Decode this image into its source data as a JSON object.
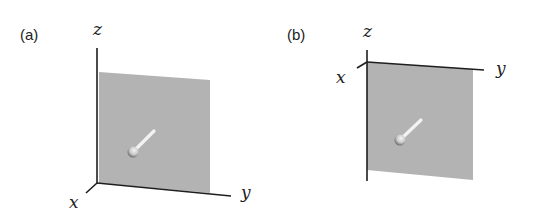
{
  "figure": {
    "colors": {
      "plane": "#b3b3b3",
      "axis": "#1e1e1e",
      "rod": "#f2f2f2",
      "sphere": "#dcdcdc",
      "sphere_shadow": "#6e6e6e"
    },
    "panels": [
      {
        "id": "a",
        "label": "(a)",
        "axes": {
          "x": "x",
          "y": "y",
          "z": "z"
        },
        "description": "Gray plane in the y–z plane with a sphere and a rod pointing up-right"
      },
      {
        "id": "b",
        "label": "(b)",
        "axes": {
          "x": "x",
          "y": "y",
          "z": "z"
        },
        "description": "Gray plane hanging below the y axis with a sphere and a rod pointing up-right"
      }
    ]
  }
}
